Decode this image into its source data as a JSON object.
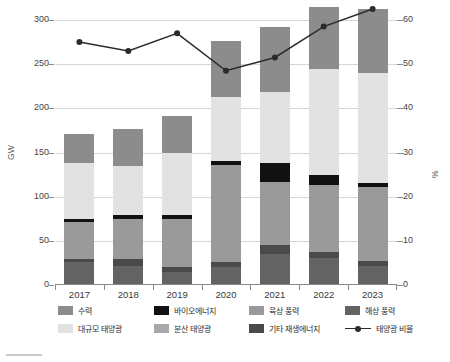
{
  "axes": {
    "ylabel_left": "GW",
    "ylabel_right": "%",
    "left_ticks": [
      "300",
      "250",
      "200",
      "150",
      "100",
      "50",
      "0"
    ],
    "right_ticks": [
      "60",
      "50",
      "40",
      "30",
      "20",
      "10",
      "0"
    ]
  },
  "legend": {
    "items": [
      {
        "label": "수력",
        "color": "#8c8c8c",
        "type": "swatch"
      },
      {
        "label": "바이오에너지",
        "color": "#111111",
        "type": "swatch"
      },
      {
        "label": "육상 풍력",
        "color": "#9a9a9a",
        "type": "swatch"
      },
      {
        "label": "해상 풍력",
        "color": "#636363",
        "type": "swatch"
      },
      {
        "label": "대규모 태양광",
        "color": "#e2e2e2",
        "type": "swatch"
      },
      {
        "label": "분산 태양광",
        "color": "#a8a8a8",
        "type": "swatch"
      },
      {
        "label": "기타 재생에너지",
        "color": "#4a4a4a",
        "type": "swatch"
      },
      {
        "label": "태양광 비율",
        "color": "#2b2b2b",
        "type": "line"
      }
    ]
  },
  "chart_data": {
    "type": "bar",
    "title": "",
    "xlabel": "",
    "ylabel": "GW",
    "y2label": "%",
    "ylim": [
      0,
      300
    ],
    "y2lim": [
      0,
      60
    ],
    "grid": true,
    "legend_position": "bottom",
    "stacked": true,
    "categories": [
      "2017",
      "2018",
      "2019",
      "2020",
      "2021",
      "2022",
      "2023"
    ],
    "series": [
      {
        "name": "해상 풍력",
        "color": "#636363",
        "values": [
          26,
          22,
          15,
          20,
          35,
          31,
          22
        ]
      },
      {
        "name": "기타 재생에너지",
        "color": "#4a4a4a",
        "values": [
          4,
          8,
          5,
          6,
          10,
          6,
          5
        ]
      },
      {
        "name": "육상 풍력",
        "color": "#9a9a9a",
        "values": [
          41,
          45,
          55,
          110,
          72,
          76,
          84
        ]
      },
      {
        "name": "바이오에너지",
        "color": "#111111",
        "values": [
          4,
          4,
          4,
          4,
          21,
          12,
          5
        ]
      },
      {
        "name": "대규모 태양광",
        "color": "#e2e2e2",
        "values": [
          63,
          56,
          70,
          73,
          80,
          119,
          124
        ]
      },
      {
        "name": "분산 태양광",
        "color": "#8c8c8c",
        "values": [
          33,
          42,
          42,
          63,
          74,
          71,
          72
        ]
      }
    ],
    "line_series": {
      "name": "태양광 비율",
      "color": "#2b2b2b",
      "axis": "right",
      "values": [
        55.0,
        53.0,
        57.0,
        48.5,
        51.5,
        58.5,
        62.5
      ]
    }
  }
}
